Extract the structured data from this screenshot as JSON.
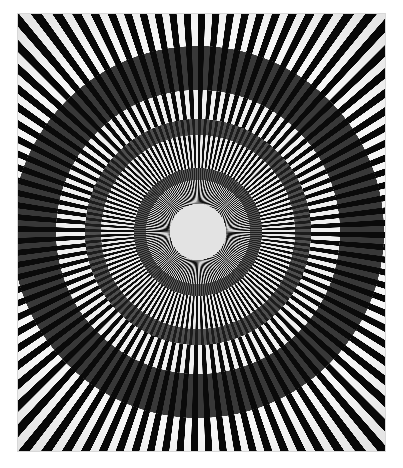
{
  "document": {
    "kind": "artwork-image",
    "title": "Concentric Radial Burst",
    "medium": "Op-art geometric composition",
    "canvas_width": 403,
    "canvas_height": 468
  },
  "colors": {
    "page_background": "#ffffff",
    "paper_margin": "#fdfdfd",
    "frame_edge": "#d8d8d8",
    "stripe_dark": "#080808",
    "stripe_light": "#f4f4f4",
    "ring_dark_charcoal": "#383838",
    "ring_mid_gray": "#4e4e4e",
    "ring_deep_black": "#0a0a0a",
    "center_disc": "#e3e3e3"
  },
  "artwork": {
    "bounds": {
      "x": 18,
      "y": 14,
      "width": 367,
      "height": 437
    },
    "center": {
      "x": 198,
      "y": 232
    },
    "center_disc_radius": 28,
    "max_radius": 300,
    "description": "Radiating black and white wedges emanating from a pale central disc, overlaid by concentric tonal annular bands of varying darkness.",
    "zones": [
      {
        "name": "inner-fine-burst",
        "r_inner": 28,
        "r_outer": 52,
        "spokes": 180,
        "dark": "#121212",
        "light": "#d6d6d6",
        "duty": 0.5
      },
      {
        "name": "ring-band-1",
        "r_inner": 52,
        "r_outer": 64,
        "spokes": 180,
        "dark": "#202020",
        "light": "#5a5a5a",
        "duty": 0.5
      },
      {
        "name": "mid-burst-a",
        "r_inner": 64,
        "r_outer": 97,
        "spokes": 120,
        "dark": "#0d0d0d",
        "light": "#ececec",
        "duty": 0.5
      },
      {
        "name": "ring-band-2",
        "r_inner": 97,
        "r_outer": 113,
        "spokes": 120,
        "dark": "#1c1c1c",
        "light": "#4e4e4e",
        "duty": 0.5
      },
      {
        "name": "mid-burst-b",
        "r_inner": 113,
        "r_outer": 142,
        "spokes": 96,
        "dark": "#0a0a0a",
        "light": "#f0f0f0",
        "duty": 0.5
      },
      {
        "name": "ring-band-3-heavy",
        "r_inner": 142,
        "r_outer": 186,
        "spokes": 96,
        "dark": "#0a0a0a",
        "light": "#383838",
        "duty": 0.5
      },
      {
        "name": "outer-burst",
        "r_inner": 186,
        "r_outer": 300,
        "spokes": 96,
        "dark": "#080808",
        "light": "#f6f6f6",
        "duty": 0.5
      }
    ]
  },
  "chart_data": {
    "type": "pie",
    "title": "Concentric Radial Burst",
    "xlabel": "",
    "ylabel": "",
    "categories": [
      "inner-fine-burst",
      "ring-band-1",
      "mid-burst-a",
      "ring-band-2",
      "mid-burst-b",
      "ring-band-3-heavy",
      "outer-burst"
    ],
    "values": [
      180,
      180,
      120,
      120,
      96,
      96,
      96
    ],
    "annotations": [
      "Spoke counts per concentric zone",
      "Stripe frequency doubles toward the center",
      "Alternating dark/light wedges at 50% duty cycle"
    ],
    "legend_position": "none",
    "grid": false
  }
}
